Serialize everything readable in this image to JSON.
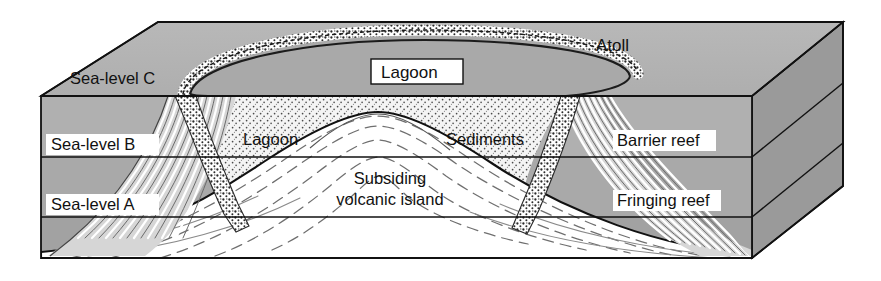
{
  "figure": {
    "type": "geological-block-diagram",
    "width": 881,
    "height": 281
  },
  "labels": {
    "sea_level_c": "Sea-level C",
    "sea_level_b": "Sea-level B",
    "sea_level_a": "Sea-level A",
    "lagoon_top": "Lagoon",
    "lagoon_section": "Lagoon",
    "atoll": "Atoll",
    "sediments": "Sediments",
    "barrier_reef": "Barrier reef",
    "fringing_reef": "Fringing reef",
    "volcano_line1": "Subsiding",
    "volcano_line2": "volcanic island"
  },
  "colors": {
    "top_face": "#b3b3b3",
    "side_face": "#9a9a9a",
    "water_upper": "#b0b0b0",
    "water_mid": "#a8a8a8",
    "water_lower": "#a0a0a0",
    "sediment_fill": "#f2f2f2",
    "island_fill": "#ffffff",
    "reef_fill": "#d8d8d8",
    "outline": "#111111",
    "label_box": "#ffffff",
    "text": "#111111"
  },
  "geometry": {
    "front_top_left": [
      41,
      96
    ],
    "front_top_right": [
      752,
      96
    ],
    "back_top_left": [
      158,
      22
    ],
    "back_top_right": [
      843,
      22
    ],
    "front_bottom_left": [
      41,
      258
    ],
    "front_bottom_right": [
      752,
      258
    ],
    "back_bottom_right": [
      843,
      186
    ],
    "sea_level_c_y": 96,
    "sea_level_b_y": 157,
    "sea_level_a_y": 217,
    "block_bottom_y": 258,
    "volcano_peak": [
      378,
      113
    ]
  },
  "label_boxes": {
    "boxed": [
      "Sea-level C",
      "Sea-level B",
      "Sea-level A",
      "Lagoon (top)",
      "Barrier reef",
      "Fringing reef"
    ],
    "unboxed": [
      "Atoll",
      "Lagoon (section)",
      "Sediments",
      "Subsiding volcanic island"
    ]
  }
}
